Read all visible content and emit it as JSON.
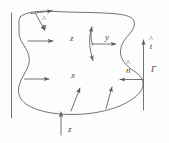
{
  "figure": {
    "stroke_color": "#5a5a5a",
    "background_color": "#fdfdfd",
    "width": 169,
    "height": 143,
    "labels": {
      "normal_top": {
        "hat": "^",
        "base": "n"
      },
      "normal_right": {
        "hat": "^",
        "base": "n"
      },
      "tangent_right": {
        "hat": "^",
        "base": "t"
      },
      "boundary_gamma": "Γ",
      "axis_z_upper": "z",
      "axis_y": "y",
      "axis_x": "x",
      "axis_z_lower": "z"
    }
  }
}
